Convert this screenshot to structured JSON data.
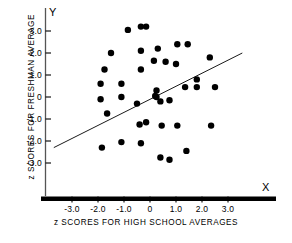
{
  "chart_data": {
    "type": "scatter",
    "title": "",
    "xlabel": "z SCORES FOR HIGH SCHOOL AVERAGES",
    "ylabel": "z SCORES FOR FRESHMAN AVERAGE",
    "x_axis_name": "X",
    "y_axis_name": "Y",
    "xlim": [
      -3.75,
      3.6
    ],
    "ylim": [
      -4.0,
      3.6
    ],
    "xticks": [
      -3.0,
      -2.0,
      -1.0,
      0,
      1.0,
      2.0,
      3.0
    ],
    "xtick_labels": [
      "-3.0",
      "-2.0",
      "-1.0",
      "0",
      "1.0",
      "2.0",
      "3.0"
    ],
    "yticks": [
      3.0,
      2.0,
      1.0,
      0,
      -1.0,
      -2.0,
      -3.0
    ],
    "ytick_labels": [
      "3.0",
      "2.0",
      "1.0",
      "0",
      "-1.0",
      "-2.0",
      "-3.0"
    ],
    "grid": false,
    "legend": null,
    "marker": "filled-circle",
    "marker_color": "#000000",
    "marker_size": 3.2,
    "points": [
      {
        "x": -0.85,
        "y": 3.05
      },
      {
        "x": -0.35,
        "y": 3.2
      },
      {
        "x": -0.15,
        "y": 3.2
      },
      {
        "x": -1.5,
        "y": 2.0
      },
      {
        "x": -0.35,
        "y": 2.1
      },
      {
        "x": 0.3,
        "y": 2.2
      },
      {
        "x": 1.05,
        "y": 2.4
      },
      {
        "x": 1.45,
        "y": 2.4
      },
      {
        "x": 0.15,
        "y": 1.65
      },
      {
        "x": 0.6,
        "y": 1.6
      },
      {
        "x": 1.0,
        "y": 1.5
      },
      {
        "x": 2.3,
        "y": 1.8
      },
      {
        "x": -1.75,
        "y": 1.25
      },
      {
        "x": -0.35,
        "y": 1.25
      },
      {
        "x": 1.8,
        "y": 0.8
      },
      {
        "x": -1.9,
        "y": 0.6
      },
      {
        "x": -1.1,
        "y": 0.6
      },
      {
        "x": 0.25,
        "y": 0.3
      },
      {
        "x": 1.35,
        "y": 0.45
      },
      {
        "x": 1.8,
        "y": 0.45
      },
      {
        "x": 2.5,
        "y": 0.45
      },
      {
        "x": -1.9,
        "y": -0.1
      },
      {
        "x": -1.1,
        "y": 0.0
      },
      {
        "x": 0.2,
        "y": 0.05
      },
      {
        "x": 0.25,
        "y": 0.0
      },
      {
        "x": -0.5,
        "y": -0.3
      },
      {
        "x": 0.4,
        "y": -0.2
      },
      {
        "x": 0.75,
        "y": -0.15
      },
      {
        "x": -1.65,
        "y": -0.75
      },
      {
        "x": -0.4,
        "y": -1.25
      },
      {
        "x": -0.15,
        "y": -1.15
      },
      {
        "x": 0.45,
        "y": -1.3
      },
      {
        "x": 1.05,
        "y": -1.3
      },
      {
        "x": 2.35,
        "y": -1.3
      },
      {
        "x": -1.1,
        "y": -2.05
      },
      {
        "x": -0.35,
        "y": -2.1
      },
      {
        "x": -1.85,
        "y": -2.3
      },
      {
        "x": 0.4,
        "y": -2.75
      },
      {
        "x": 0.75,
        "y": -2.85
      },
      {
        "x": 1.4,
        "y": -2.45
      }
    ],
    "regression_line": {
      "label": "regression-line",
      "color": "#000000",
      "x_start": -3.7,
      "y_start": -2.3,
      "x_end": 3.55,
      "y_end": 2.0
    }
  }
}
